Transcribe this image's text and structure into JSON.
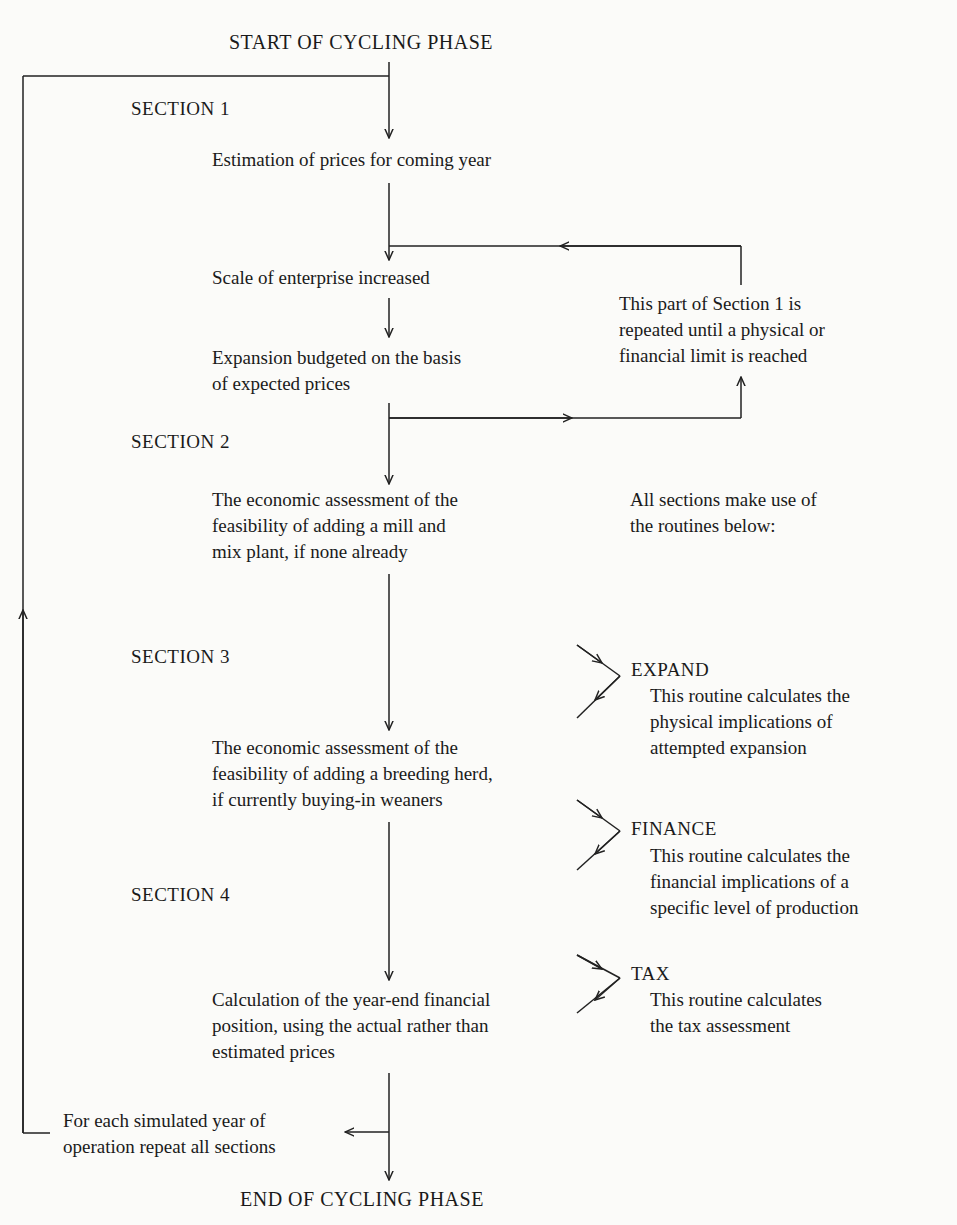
{
  "diagram": {
    "start_label": "START OF CYCLING PHASE",
    "end_label": "END OF CYCLING PHASE",
    "sections": [
      {
        "label": "SECTION 1",
        "steps": [
          [
            "Estimation of prices for coming year"
          ],
          [
            "Scale of enterprise increased"
          ],
          [
            "Expansion budgeted on the basis",
            "of expected prices"
          ]
        ],
        "loop_note": [
          "This part of Section 1 is",
          "repeated until a physical or",
          "financial limit is reached"
        ]
      },
      {
        "label": "SECTION 2",
        "steps": [
          [
            "The economic assessment of the",
            "feasibility of adding a mill and",
            "mix plant, if none already"
          ]
        ]
      },
      {
        "label": "SECTION 3",
        "steps": [
          [
            "The economic assessment of the",
            "feasibility of adding a breeding herd,",
            "if currently buying-in weaners"
          ]
        ]
      },
      {
        "label": "SECTION 4",
        "steps": [
          [
            "Calculation of the year-end financial",
            "position, using the actual rather than",
            "estimated prices"
          ]
        ]
      }
    ],
    "routines_intro": [
      "All sections make use of",
      "the routines below:"
    ],
    "routines": [
      {
        "name": "EXPAND",
        "description": [
          "This routine calculates the",
          "physical implications of",
          "attempted expansion"
        ]
      },
      {
        "name": "FINANCE",
        "description": [
          "This routine calculates the",
          "financial implications of a",
          "specific level of production"
        ]
      },
      {
        "name": "TAX",
        "description": [
          "This routine calculates",
          "the tax assessment"
        ]
      }
    ],
    "repeat_note": [
      "For each simulated year of",
      "operation repeat all sections"
    ]
  }
}
